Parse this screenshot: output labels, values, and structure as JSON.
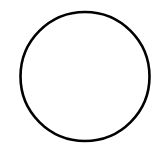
{
  "diagram": {
    "background": "#ffffff",
    "shapes": [
      {
        "type": "circle",
        "cx": 85,
        "cy": 76.5,
        "r": 64.5,
        "stroke": "#000000",
        "stroke_width": 2.6,
        "fill": "none"
      }
    ]
  }
}
